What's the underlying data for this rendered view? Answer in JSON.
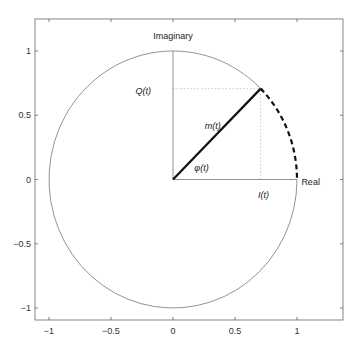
{
  "chart_data": {
    "type": "diagram",
    "title": "",
    "xlabel": "",
    "ylabel": "",
    "xlim": [
      -1.1,
      1.35
    ],
    "ylim": [
      -1.1,
      1.25
    ],
    "grid": false,
    "x_ticks": [
      -1,
      -0.5,
      0,
      0.5,
      1
    ],
    "x_tick_labels": [
      "−1",
      "−0.5",
      "0",
      "0.5",
      "1"
    ],
    "y_ticks": [
      -1,
      -0.5,
      0,
      0.5,
      1
    ],
    "y_tick_labels": [
      "−1",
      "−0.5",
      "0",
      "0.5",
      "1"
    ],
    "elements": {
      "unit_circle": {
        "center": [
          0,
          0
        ],
        "radius": 1,
        "style": "thin solid",
        "color": "#777777",
        "omitted_arc_deg": [
          0,
          45
        ]
      },
      "dashed_arc": {
        "center": [
          0,
          0
        ],
        "radius": 1,
        "from_deg": 0,
        "to_deg": 45,
        "style": "thick dashed",
        "color": "#111111"
      },
      "imaginary_axis": {
        "from": [
          0,
          0
        ],
        "to": [
          0,
          1
        ],
        "color": "#777777"
      },
      "real_axis": {
        "from": [
          0,
          0
        ],
        "to": [
          1,
          0
        ],
        "color": "#777777"
      },
      "phasor_m": {
        "from": [
          0,
          0
        ],
        "to": [
          0.7071,
          0.7071
        ],
        "style": "thick solid",
        "color": "#111111"
      },
      "projection_Q": {
        "from": [
          0,
          0.7071
        ],
        "to": [
          0.7071,
          0.7071
        ],
        "style": "dotted",
        "color": "#bbbbbb"
      },
      "projection_I": {
        "from": [
          0.7071,
          0
        ],
        "to": [
          0.7071,
          0.7071
        ],
        "style": "dotted",
        "color": "#bbbbbb"
      }
    },
    "annotations": [
      {
        "id": "imaginary",
        "text": "Imaginary",
        "x": 0.0,
        "y": 1.12,
        "italic": false
      },
      {
        "id": "real",
        "text": "Real",
        "x": 1.11,
        "y": -0.02,
        "italic": false
      },
      {
        "id": "Q",
        "text": "Q(t)",
        "x": -0.24,
        "y": 0.69,
        "italic": true
      },
      {
        "id": "m",
        "text": "m(t)",
        "x": 0.32,
        "y": 0.42,
        "italic": true
      },
      {
        "id": "phi",
        "text": "φ(t)",
        "x": 0.23,
        "y": 0.09,
        "italic": true
      },
      {
        "id": "I",
        "text": "I(t)",
        "x": 0.73,
        "y": -0.12,
        "italic": true
      }
    ]
  },
  "layout": {
    "axes_box": {
      "left": 35,
      "top": 19,
      "right": 343,
      "bottom": 320
    },
    "origin_px": [
      173,
      179.5
    ],
    "px_per_unit_x": 124,
    "px_per_unit_y": 128.5
  }
}
